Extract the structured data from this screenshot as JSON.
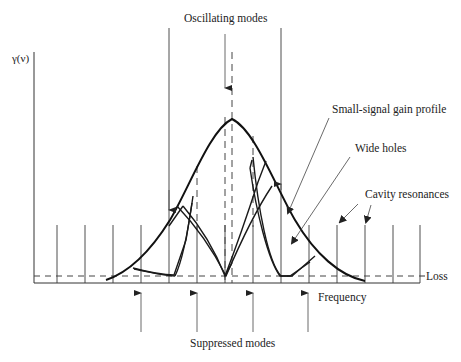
{
  "diagram": {
    "y_axis_label": "γ(ν)",
    "x_axis_label": "Frequency",
    "loss_label": "Loss",
    "annotations": {
      "oscillating_modes": "Oscillating modes",
      "small_signal_gain_profile": "Small-signal gain profile",
      "wide_holes": "Wide holes",
      "cavity_resonances": "Cavity resonances",
      "suppressed_modes": "Suppressed modes"
    },
    "colors": {
      "line": "#111111",
      "background": "#ffffff"
    }
  }
}
